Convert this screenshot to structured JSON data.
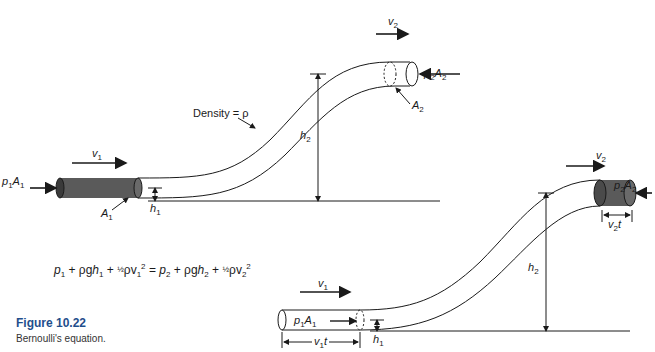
{
  "figure": {
    "title": "Figure 10.22",
    "caption": "Bernoulli's equation.",
    "accent_color": "#1f4e8c"
  },
  "top_diagram": {
    "density_label": "Density = ρ",
    "p1A1": {
      "base": "p",
      "sub1": "1",
      "mid": "A",
      "sub2": "1"
    },
    "v1": {
      "base": "v",
      "sub": "1"
    },
    "A1": {
      "base": "A",
      "sub": "1"
    },
    "h1": {
      "base": "h",
      "sub": "1"
    },
    "v2": {
      "base": "v",
      "sub": "2"
    },
    "p2A2": {
      "base": "p",
      "sub1": "2",
      "mid": "A",
      "sub2": "2"
    },
    "A2": {
      "base": "A",
      "sub": "2"
    },
    "h2": {
      "base": "h",
      "sub": "2"
    }
  },
  "equation": {
    "lhs_p": "p",
    "lhs_p_sub": "1",
    "plus1": " + ρg",
    "lhs_h": "h",
    "lhs_h_sub": "1",
    "plus2": " + ",
    "half": "½",
    "rho_v": "ρv",
    "lhs_v_sub": "1",
    "sq": "2",
    "equals": " = ",
    "rhs_p": "p",
    "rhs_p_sub": "2",
    "plus3": " + ρg",
    "rhs_h": "h",
    "rhs_h_sub": "2",
    "plus4": " + ",
    "half2": "½",
    "rho_v2": "ρv",
    "rhs_v_sub": "2",
    "sq2": "2"
  },
  "bottom_diagram": {
    "v1": {
      "base": "v",
      "sub": "1"
    },
    "p1A1": {
      "base": "p",
      "sub1": "1",
      "mid": "A",
      "sub2": "1"
    },
    "h1": {
      "base": "h",
      "sub": "1"
    },
    "v1t": {
      "base": "v",
      "sub": "1",
      "tail": "t"
    },
    "v2": {
      "base": "v",
      "sub": "2"
    },
    "p2A2": {
      "base": "p",
      "sub1": "2",
      "mid": "A",
      "sub2": "2"
    },
    "v2t": {
      "base": "v",
      "sub": "2",
      "tail": "t"
    },
    "h2": {
      "base": "h",
      "sub": "2"
    }
  }
}
